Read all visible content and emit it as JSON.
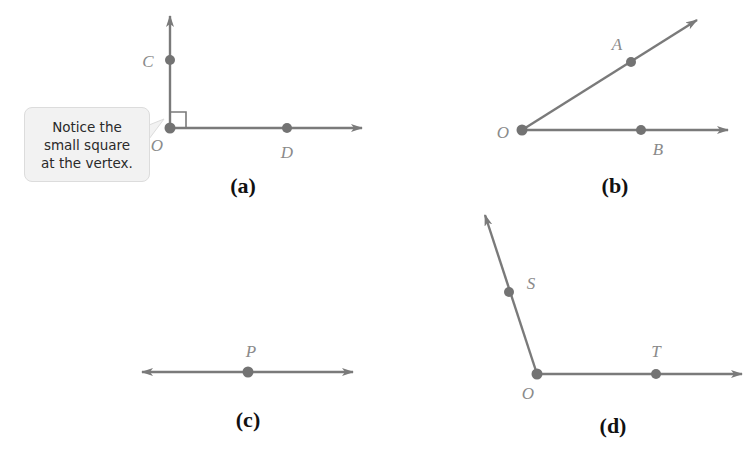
{
  "colors": {
    "line": "#7a7a7a",
    "point": "#737373",
    "label": "#8a8a8a",
    "caption": "#111111",
    "callout_bg": "#f2f2f2",
    "callout_border": "#dcdcdc"
  },
  "figures": {
    "a": {
      "caption": "(a)",
      "description": "Right angle COD with vertex O",
      "points": {
        "C": "C",
        "O": "O",
        "D": "D"
      },
      "callout": {
        "lines": [
          "Notice the",
          "small square",
          "at the vertex."
        ]
      }
    },
    "b": {
      "caption": "(b)",
      "description": "Acute angle AOB with vertex O",
      "points": {
        "A": "A",
        "O": "O",
        "B": "B"
      }
    },
    "c": {
      "caption": "(c)",
      "description": "Straight line with point P",
      "points": {
        "P": "P"
      }
    },
    "d": {
      "caption": "(d)",
      "description": "Obtuse angle SOT with vertex O",
      "points": {
        "S": "S",
        "O": "O",
        "T": "T"
      }
    }
  }
}
